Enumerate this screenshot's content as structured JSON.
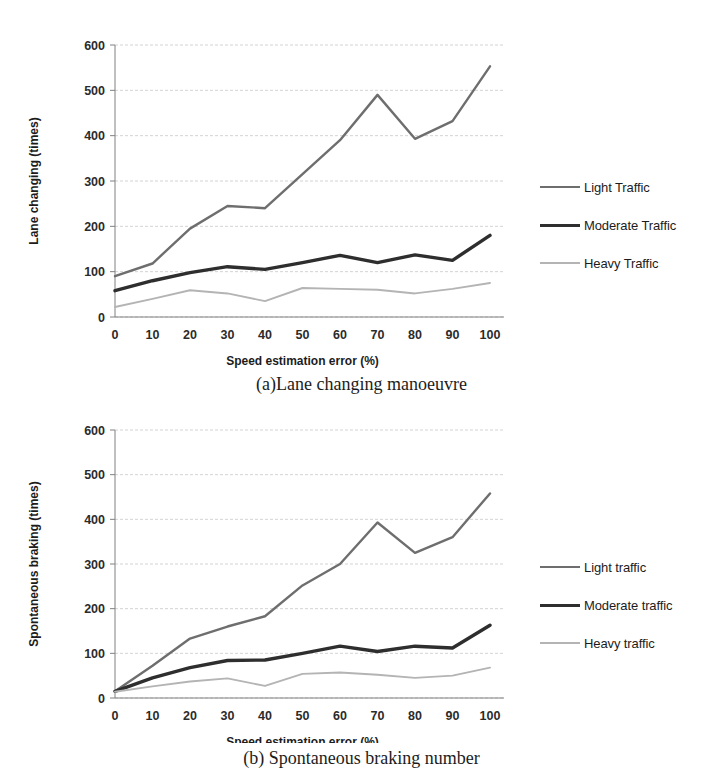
{
  "figure": {
    "panels": [
      {
        "id": "a",
        "caption": "(a)Lane changing manoeuvre",
        "xlabel": "Speed estimation error (%)",
        "ylabel": "Lane changing (times)",
        "yticks": [
          "600",
          "500",
          "400",
          "300",
          "200",
          "100",
          "0"
        ],
        "xticks": [
          "0",
          "10",
          "20",
          "30",
          "40",
          "50",
          "60",
          "70",
          "80",
          "90",
          "100"
        ],
        "legend": [
          {
            "label": "Light Traffic",
            "key": "light"
          },
          {
            "label": "Moderate Traffic",
            "key": "moderate"
          },
          {
            "label": "Heavy Traffic",
            "key": "heavy"
          }
        ]
      },
      {
        "id": "b",
        "caption": "(b) Spontaneous braking number",
        "xlabel": "Speed estimation error (%)",
        "ylabel": "Spontaneous braking (times)",
        "yticks": [
          "600",
          "500",
          "400",
          "300",
          "200",
          "100",
          "0"
        ],
        "xticks": [
          "0",
          "10",
          "20",
          "30",
          "40",
          "50",
          "60",
          "70",
          "80",
          "90",
          "100"
        ],
        "legend": [
          {
            "label": "Light traffic",
            "key": "light"
          },
          {
            "label": "Moderate traffic",
            "key": "moderate"
          },
          {
            "label": "Heavy traffic",
            "key": "heavy"
          }
        ]
      }
    ],
    "colors": {
      "light": "#6e6e6e",
      "moderate": "#2e2e2e",
      "heavy": "#b4b4b4",
      "grid": "#c8c8c8",
      "axis": "#808080",
      "text": "#1c1c1c"
    }
  },
  "chart_data": [
    {
      "type": "line",
      "title": "(a)Lane changing manoeuvre",
      "xlabel": "Speed estimation error (%)",
      "ylabel": "Lane changing (times)",
      "x": [
        0,
        10,
        20,
        30,
        40,
        50,
        60,
        70,
        80,
        90,
        100
      ],
      "xlim": [
        0,
        100
      ],
      "ylim": [
        0,
        600
      ],
      "yticks": [
        0,
        100,
        200,
        300,
        400,
        500,
        600
      ],
      "grid": true,
      "legend_position": "right",
      "series": [
        {
          "name": "Light Traffic",
          "values": [
            90,
            118,
            195,
            245,
            240,
            315,
            390,
            490,
            393,
            432,
            553
          ]
        },
        {
          "name": "Moderate Traffic",
          "values": [
            58,
            80,
            98,
            111,
            105,
            120,
            136,
            120,
            137,
            125,
            180
          ]
        },
        {
          "name": "Heavy Traffic",
          "values": [
            22,
            40,
            59,
            52,
            35,
            64,
            62,
            60,
            52,
            62,
            75
          ]
        }
      ]
    },
    {
      "type": "line",
      "title": "(b) Spontaneous braking number",
      "xlabel": "Speed estimation error (%)",
      "ylabel": "Spontaneous braking (times)",
      "x": [
        0,
        10,
        20,
        30,
        40,
        50,
        60,
        70,
        80,
        90,
        100
      ],
      "xlim": [
        0,
        100
      ],
      "ylim": [
        0,
        600
      ],
      "yticks": [
        0,
        100,
        200,
        300,
        400,
        500,
        600
      ],
      "grid": true,
      "legend_position": "right",
      "series": [
        {
          "name": "Light traffic",
          "values": [
            15,
            72,
            133,
            160,
            183,
            252,
            300,
            393,
            325,
            360,
            458
          ]
        },
        {
          "name": "Moderate traffic",
          "values": [
            15,
            45,
            68,
            84,
            85,
            100,
            116,
            104,
            116,
            112,
            163
          ]
        },
        {
          "name": "Heavy traffic",
          "values": [
            14,
            26,
            37,
            44,
            27,
            54,
            57,
            52,
            45,
            50,
            68
          ]
        }
      ]
    }
  ]
}
